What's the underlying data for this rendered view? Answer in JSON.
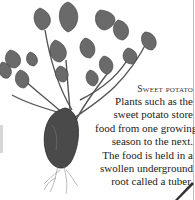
{
  "caption": {
    "title": "Sweet potato",
    "lines": [
      "Plants such as the",
      "sweet potato store",
      "food from one growing",
      "season to the next.",
      "The food is held in a",
      "swollen underground",
      "root called a tuber."
    ]
  },
  "illustration": {
    "subject": "sweet-potato-plant",
    "leaf_color": "#5a5a5a",
    "tuber_color": "#3f3f3f"
  },
  "colors": {
    "background": "#ffffff",
    "text": "#222222",
    "rule": "#bdbdbd"
  }
}
